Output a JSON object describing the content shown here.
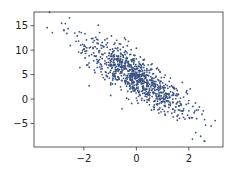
{
  "chart_data": {
    "type": "scatter",
    "title": "",
    "xlabel": "",
    "ylabel": "",
    "xlim": [
      -3.9,
      3.3
    ],
    "ylim": [
      -9.8,
      17.8
    ],
    "grid": false,
    "legend": "none",
    "marker_color": "#3b5283",
    "xticks": [
      -2,
      0,
      2
    ],
    "xtick_labels": [
      "−2",
      "0",
      "2"
    ],
    "yticks": [
      -5,
      0,
      5,
      10,
      15
    ],
    "ytick_labels": [
      "−5",
      "0",
      "5",
      "10",
      "15"
    ],
    "trend": {
      "slope": -3.4,
      "intercept": 4.2,
      "noise_sd": 2.0
    },
    "series": [
      {
        "name": "features vs labels",
        "points": [
          [
            -3.4,
            14.6
          ],
          [
            -3.2,
            13.6
          ],
          [
            -2.85,
            15.5
          ],
          [
            -2.65,
            13.4
          ],
          [
            -2.55,
            16.6
          ],
          [
            -2.6,
            14.4
          ],
          [
            -2.35,
            13.5
          ],
          [
            -2.3,
            11.8
          ],
          [
            -2.25,
            12.9
          ],
          [
            -2.2,
            9.6
          ],
          [
            -2.1,
            13.6
          ],
          [
            -2.05,
            11.2
          ],
          [
            -2.0,
            10.2
          ],
          [
            -1.95,
            8.4
          ],
          [
            -1.9,
            12.1
          ],
          [
            -1.85,
            7.0
          ],
          [
            -1.8,
            6.5
          ],
          [
            -1.8,
            2.7
          ],
          [
            -1.75,
            10.6
          ],
          [
            -1.7,
            9.1
          ],
          [
            -1.65,
            11.6
          ],
          [
            -1.6,
            8.8
          ],
          [
            -1.55,
            12.6
          ],
          [
            -1.5,
            10.3
          ],
          [
            -1.45,
            15.1
          ],
          [
            -1.45,
            7.8
          ],
          [
            -1.4,
            13.6
          ],
          [
            -1.4,
            9.9
          ],
          [
            -1.35,
            11.0
          ],
          [
            -1.3,
            8.3
          ],
          [
            -1.3,
            6.2
          ],
          [
            -1.25,
            10.7
          ],
          [
            -1.2,
            12.1
          ],
          [
            -1.2,
            9.4
          ],
          [
            -1.15,
            7.4
          ],
          [
            -1.1,
            11.5
          ],
          [
            -1.1,
            4.6
          ],
          [
            -1.05,
            8.9
          ],
          [
            -1.0,
            10.1
          ],
          [
            -1.0,
            6.8
          ],
          [
            -0.95,
            12.9
          ],
          [
            -0.95,
            8.1
          ],
          [
            -0.9,
            9.6
          ],
          [
            -0.9,
            5.2
          ],
          [
            -0.85,
            11.2
          ],
          [
            -0.85,
            7.5
          ],
          [
            -0.8,
            10.4
          ],
          [
            -0.8,
            6.4
          ],
          [
            -0.8,
            3.1
          ],
          [
            -0.75,
            8.8
          ],
          [
            -0.75,
            12.0
          ],
          [
            -0.7,
            7.1
          ],
          [
            -0.7,
            9.9
          ],
          [
            -0.7,
            4.5
          ],
          [
            -0.65,
            6.0
          ],
          [
            -0.65,
            11.3
          ],
          [
            -0.6,
            8.2
          ],
          [
            -0.6,
            5.6
          ],
          [
            -0.6,
            9.4
          ],
          [
            -0.55,
            7.6
          ],
          [
            -0.55,
            3.8
          ],
          [
            -0.5,
            10.6
          ],
          [
            -0.5,
            6.8
          ],
          [
            -0.5,
            8.9
          ],
          [
            -0.45,
            5.1
          ],
          [
            -0.45,
            7.3
          ],
          [
            -0.4,
            9.7
          ],
          [
            -0.4,
            6.2
          ],
          [
            -0.4,
            4.2
          ],
          [
            -0.35,
            8.3
          ],
          [
            -0.35,
            10.9
          ],
          [
            -0.3,
            5.8
          ],
          [
            -0.3,
            7.7
          ],
          [
            -0.3,
            3.4
          ],
          [
            -0.25,
            9.1
          ],
          [
            -0.25,
            6.6
          ],
          [
            -0.2,
            4.9
          ],
          [
            -0.2,
            8.0
          ],
          [
            -0.2,
            10.1
          ],
          [
            -0.15,
            6.1
          ],
          [
            -0.15,
            2.6
          ],
          [
            -0.1,
            7.4
          ],
          [
            -0.1,
            5.3
          ],
          [
            -0.1,
            9.0
          ],
          [
            -0.05,
            4.1
          ],
          [
            -0.05,
            6.7
          ],
          [
            0.0,
            8.2
          ],
          [
            0.0,
            5.0
          ],
          [
            0.0,
            2.9
          ],
          [
            0.0,
            10.4
          ],
          [
            0.05,
            6.3
          ],
          [
            0.05,
            3.7
          ],
          [
            0.1,
            7.6
          ],
          [
            0.1,
            4.6
          ],
          [
            0.1,
            1.3
          ],
          [
            0.15,
            5.7
          ],
          [
            0.15,
            8.6
          ],
          [
            0.2,
            3.2
          ],
          [
            0.2,
            6.5
          ],
          [
            0.2,
            4.1
          ],
          [
            0.25,
            7.1
          ],
          [
            0.25,
            2.2
          ],
          [
            0.3,
            5.3
          ],
          [
            0.3,
            3.6
          ],
          [
            0.3,
            8.1
          ],
          [
            0.35,
            4.4
          ],
          [
            0.35,
            0.9
          ],
          [
            0.4,
            6.2
          ],
          [
            0.4,
            2.8
          ],
          [
            0.4,
            4.9
          ],
          [
            0.45,
            3.3
          ],
          [
            0.45,
            7.0
          ],
          [
            0.5,
            1.8
          ],
          [
            0.5,
            5.4
          ],
          [
            0.5,
            3.9
          ],
          [
            0.55,
            2.5
          ],
          [
            0.55,
            6.1
          ],
          [
            0.6,
            4.3
          ],
          [
            0.6,
            0.5
          ],
          [
            0.6,
            2.9
          ],
          [
            0.65,
            5.2
          ],
          [
            0.65,
            1.4
          ],
          [
            0.7,
            3.6
          ],
          [
            0.7,
            -0.4
          ],
          [
            0.7,
            2.3
          ],
          [
            0.75,
            4.7
          ],
          [
            0.75,
            0.8
          ],
          [
            0.8,
            2.9
          ],
          [
            0.8,
            6.3
          ],
          [
            0.8,
            -1.2
          ],
          [
            0.85,
            1.7
          ],
          [
            0.85,
            3.8
          ],
          [
            0.9,
            0.2
          ],
          [
            0.9,
            2.4
          ],
          [
            0.95,
            4.4
          ],
          [
            0.95,
            -0.8
          ],
          [
            1.0,
            1.3
          ],
          [
            1.0,
            3.3
          ],
          [
            1.0,
            -2.1
          ],
          [
            1.05,
            0.6
          ],
          [
            1.05,
            2.7
          ],
          [
            1.1,
            4.9
          ],
          [
            1.1,
            -1.5
          ],
          [
            1.15,
            1.1
          ],
          [
            1.15,
            -0.3
          ],
          [
            1.2,
            2.2
          ],
          [
            1.2,
            -2.6
          ],
          [
            1.25,
            0.3
          ],
          [
            1.25,
            3.6
          ],
          [
            1.3,
            -1.0
          ],
          [
            1.3,
            1.5
          ],
          [
            1.35,
            -2.9
          ],
          [
            1.4,
            0.8
          ],
          [
            1.4,
            -0.7
          ],
          [
            1.45,
            2.1
          ],
          [
            1.5,
            -1.6
          ],
          [
            1.5,
            0.1
          ],
          [
            1.55,
            -3.5
          ],
          [
            1.6,
            1.0
          ],
          [
            1.6,
            -2.2
          ],
          [
            1.65,
            -0.5
          ],
          [
            1.7,
            -1.3
          ],
          [
            1.75,
            -3.0
          ],
          [
            1.75,
            3.4
          ],
          [
            1.8,
            0.4
          ],
          [
            1.8,
            -2.0
          ],
          [
            1.85,
            -4.1
          ],
          [
            1.9,
            1.4
          ],
          [
            1.9,
            -1.1
          ],
          [
            1.95,
            -3.3
          ],
          [
            2.0,
            -0.3
          ],
          [
            2.0,
            -2.4
          ],
          [
            2.05,
            2.1
          ],
          [
            2.1,
            -3.8
          ],
          [
            2.15,
            -1.5
          ],
          [
            2.2,
            -2.8
          ],
          [
            2.25,
            -0.8
          ],
          [
            2.3,
            -4.0
          ],
          [
            2.35,
            -2.2
          ],
          [
            2.4,
            -1.6
          ],
          [
            2.45,
            -7.6
          ],
          [
            2.5,
            -3.1
          ],
          [
            2.55,
            -2.4
          ],
          [
            2.6,
            -8.6
          ],
          [
            2.6,
            -4.2
          ],
          [
            2.85,
            -5.5
          ],
          [
            -1.0,
            5.5
          ],
          [
            -0.6,
            2.5
          ],
          [
            0.3,
            6.9
          ],
          [
            0.2,
            -0.2
          ],
          [
            -0.3,
            11.8
          ],
          [
            -0.9,
            3.9
          ],
          [
            0.6,
            7.2
          ],
          [
            1.3,
            4.3
          ],
          [
            -1.6,
            5.9
          ],
          [
            0.9,
            5.6
          ],
          [
            -0.45,
            12.5
          ],
          [
            0.0,
            0.2
          ],
          [
            1.1,
            -3.3
          ],
          [
            -1.2,
            4.0
          ]
        ]
      }
    ]
  }
}
